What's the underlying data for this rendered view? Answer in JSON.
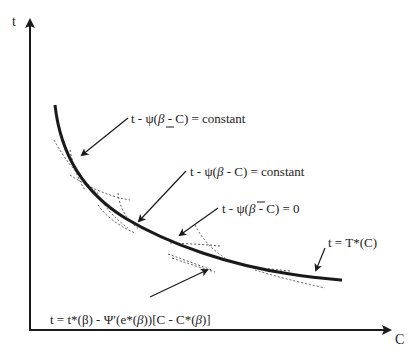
{
  "diagram": {
    "axes": {
      "y_label": "t",
      "x_label": "C"
    },
    "curve": {
      "name": "T*(C)",
      "style": "solid-thick",
      "color": "#1a1a1a"
    },
    "labels": {
      "lower_constant": {
        "prefix": "t - ψ(",
        "beta": "β",
        "beta_mark": "underline",
        "suffix": " - C) = constant"
      },
      "mid_constant": {
        "prefix": "t - ψ(",
        "beta": "β",
        "suffix": " - C) = constant"
      },
      "upper_zero": {
        "prefix": "t - ψ(",
        "beta": "β",
        "beta_mark": "overline",
        "suffix": " - C) = 0"
      },
      "envelope": {
        "text": "t = T*(C)"
      },
      "tangent": {
        "part1": "t = t*(β) - ",
        "psi": "Ψ′",
        "part2": "(e*(",
        "beta1": "β",
        "part3": "))[C - C*(",
        "beta2": "β",
        "part4": ")]"
      }
    },
    "colors": {
      "ink": "#1a1a1a",
      "dotted": "#555555",
      "background": "#ffffff"
    }
  }
}
